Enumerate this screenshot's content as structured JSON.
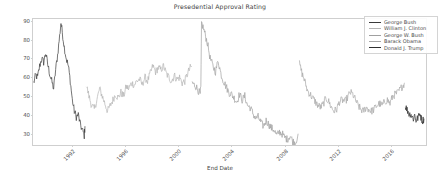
{
  "chart_data": {
    "type": "line",
    "title": "Presedential Approval Rating",
    "xlabel": "End Date",
    "ylabel": "",
    "grid": false,
    "legend_position": "upper right",
    "xlim": [
      1989.1,
      2018.6
    ],
    "ylim": [
      24,
      91
    ],
    "yticks": [
      30,
      40,
      50,
      60,
      70,
      80,
      90
    ],
    "xticks": [
      1992,
      1996,
      2000,
      2004,
      2008,
      2012,
      2016
    ],
    "xtick_labels": [
      "1992",
      "1996",
      "2000",
      "2004",
      "2008",
      "2012",
      "2016"
    ],
    "ytick_labels": [
      "30",
      "40",
      "50",
      "60",
      "70",
      "80",
      "90"
    ],
    "series": [
      {
        "name": "George Bush",
        "color": "#3a3a3a",
        "x": [
          1989.15,
          1989.3,
          1989.45,
          1989.6,
          1989.75,
          1989.9,
          1990.05,
          1990.2,
          1990.35,
          1990.5,
          1990.65,
          1990.8,
          1990.95,
          1991.1,
          1991.2,
          1991.3,
          1991.45,
          1991.6,
          1991.75,
          1991.9,
          1992.05,
          1992.2,
          1992.35,
          1992.5,
          1992.65,
          1992.8,
          1992.95,
          1993.0
        ],
        "values": [
          57,
          61,
          60,
          66,
          70,
          68,
          73,
          67,
          62,
          58,
          54,
          64,
          72,
          82,
          89,
          84,
          76,
          70,
          66,
          58,
          48,
          42,
          39,
          40,
          35,
          32,
          29,
          34
        ]
      },
      {
        "name": "William J. Clinton",
        "color": "#b4b4b4",
        "x": [
          1993.1,
          1993.3,
          1993.5,
          1993.7,
          1993.9,
          1994.1,
          1994.3,
          1994.5,
          1994.7,
          1994.9,
          1995.1,
          1995.3,
          1995.5,
          1995.7,
          1995.9,
          1996.1,
          1996.3,
          1996.5,
          1996.7,
          1996.9,
          1997.1,
          1997.3,
          1997.5,
          1997.7,
          1997.9,
          1998.1,
          1998.3,
          1998.5,
          1998.7,
          1998.9,
          1999.1,
          1999.3,
          1999.5,
          1999.7,
          1999.9,
          2000.1,
          2000.3,
          2000.5,
          2000.7,
          2000.9,
          2001.0
        ],
        "values": [
          56,
          50,
          45,
          43,
          48,
          54,
          50,
          46,
          42,
          45,
          48,
          51,
          49,
          52,
          50,
          55,
          54,
          57,
          56,
          58,
          59,
          56,
          60,
          58,
          62,
          66,
          63,
          65,
          64,
          66,
          62,
          60,
          58,
          61,
          59,
          60,
          57,
          58,
          62,
          65,
          66
        ]
      },
      {
        "name": "George W. Bush",
        "color": "#a0a0a0",
        "x": [
          2001.05,
          2001.2,
          2001.35,
          2001.5,
          2001.65,
          2001.7,
          2001.75,
          2001.9,
          2002.05,
          2002.2,
          2002.4,
          2002.6,
          2002.8,
          2003.0,
          2003.2,
          2003.4,
          2003.6,
          2003.8,
          2004.0,
          2004.2,
          2004.4,
          2004.6,
          2004.8,
          2005.0,
          2005.2,
          2005.4,
          2005.6,
          2005.8,
          2006.0,
          2006.2,
          2006.4,
          2006.6,
          2006.8,
          2007.0,
          2007.2,
          2007.4,
          2007.6,
          2007.8,
          2008.0,
          2008.2,
          2008.4,
          2008.6,
          2008.8,
          2009.0
        ],
        "values": [
          57,
          56,
          55,
          53,
          51,
          55,
          89,
          86,
          82,
          78,
          70,
          66,
          63,
          69,
          62,
          58,
          55,
          52,
          51,
          49,
          47,
          51,
          48,
          50,
          45,
          44,
          41,
          38,
          39,
          36,
          34,
          37,
          35,
          33,
          32,
          29,
          31,
          30,
          28,
          27,
          29,
          26,
          25,
          30
        ]
      },
      {
        "name": "Barack Obama",
        "color": "#a8a8a8",
        "x": [
          2009.1,
          2009.3,
          2009.5,
          2009.7,
          2009.9,
          2010.1,
          2010.3,
          2010.5,
          2010.7,
          2010.9,
          2011.1,
          2011.3,
          2011.5,
          2011.7,
          2011.9,
          2012.1,
          2012.3,
          2012.5,
          2012.7,
          2012.9,
          2013.1,
          2013.3,
          2013.5,
          2013.7,
          2013.9,
          2014.1,
          2014.3,
          2014.5,
          2014.7,
          2014.9,
          2015.1,
          2015.3,
          2015.5,
          2015.7,
          2015.9,
          2016.1,
          2016.3,
          2016.5,
          2016.7,
          2016.9,
          2017.0
        ],
        "values": [
          67,
          62,
          58,
          53,
          51,
          49,
          47,
          45,
          44,
          46,
          49,
          47,
          44,
          42,
          43,
          47,
          48,
          47,
          49,
          52,
          51,
          48,
          45,
          43,
          42,
          44,
          43,
          42,
          43,
          45,
          46,
          45,
          47,
          48,
          46,
          50,
          51,
          52,
          54,
          56,
          57
        ]
      },
      {
        "name": "Donald J. Trump",
        "color": "#2f2f2f",
        "x": [
          2017.05,
          2017.15,
          2017.25,
          2017.35,
          2017.45,
          2017.55,
          2017.65,
          2017.75,
          2017.85,
          2017.95,
          2018.05,
          2018.15,
          2018.25,
          2018.35,
          2018.45
        ],
        "values": [
          45,
          43,
          42,
          40,
          41,
          39,
          38,
          40,
          37,
          38,
          39,
          41,
          38,
          37,
          38
        ]
      }
    ]
  }
}
